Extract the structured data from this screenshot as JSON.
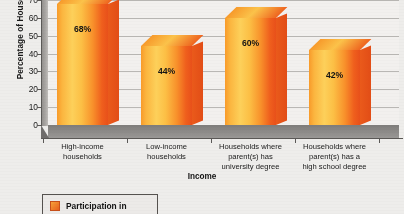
{
  "chart_data": {
    "type": "bar",
    "title": "",
    "categories": [
      "High-income households",
      "Low-income households",
      "Households where parent(s) has university degree",
      "Households where parent(s) has a high school degree"
    ],
    "values": [
      68,
      44,
      60,
      42
    ],
    "data_labels": [
      "68%",
      "44%",
      "60%",
      "42%"
    ],
    "xlabel": "Income",
    "ylabel": "Percentage of Households",
    "ylim": [
      0,
      70
    ],
    "ytick_values": [
      70,
      60,
      50,
      40,
      30,
      20,
      10,
      0
    ],
    "ytick_labels": [
      "70",
      "60",
      "50",
      "40",
      "30",
      "20",
      "10",
      "0"
    ],
    "grid": true,
    "legend_position": "bottom-left",
    "legend": [
      {
        "label": "Participation in",
        "color": "#ef6a1e"
      }
    ],
    "series": [
      {
        "name": "Participation in",
        "values": [
          68,
          44,
          60,
          42
        ],
        "color": "#ef6a1e"
      }
    ],
    "style": "3d-bar",
    "colors": {
      "bar_light": "#fdd05a",
      "bar_mid": "#f8912b",
      "bar_dark": "#e8501a",
      "plot_background": "#f2f0ee",
      "figure_background": "#eeedeb",
      "gridline": "#b9b7b4",
      "axis": "#5b5957",
      "floor": "#8b8987",
      "text": "#1a1a1a"
    }
  },
  "category_label_lines": [
    [
      "High-income",
      "households"
    ],
    [
      "Low-income",
      "households"
    ],
    [
      "Households where",
      "parent(s) has",
      "university degree"
    ],
    [
      "Households where",
      "parent(s) has a",
      "high school degree"
    ]
  ]
}
